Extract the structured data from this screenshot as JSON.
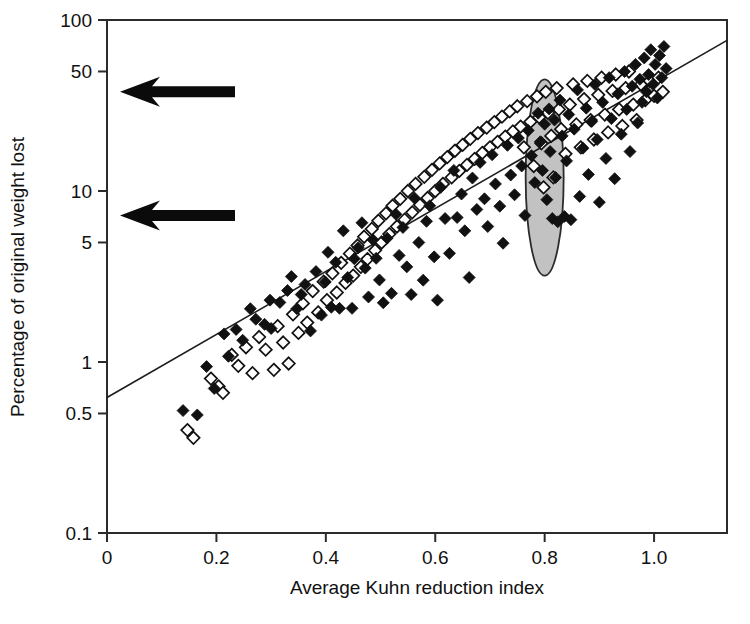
{
  "figure": {
    "background_color": "#ffffff",
    "foreground_color": "#111111",
    "highlight_fill_color": "#c2c2c2",
    "marker_filled_color": "#111111",
    "marker_open_color": "#ffffff",
    "caption_partial": ""
  },
  "chart_data": {
    "type": "scatter",
    "title": "",
    "xlabel": "Average Kuhn reduction index",
    "ylabel": "Percentage of original weight lost",
    "xlim": [
      0,
      1.1333
    ],
    "ylim": [
      0.1,
      100
    ],
    "yscale": "log",
    "xscale": "linear",
    "grid": false,
    "legend": "none",
    "xticks": [
      0,
      0.2,
      0.4,
      0.6,
      0.8,
      1.0
    ],
    "xtick_labels": [
      "0",
      "0.2",
      "0.4",
      "0.6",
      "0.8",
      "1.0"
    ],
    "yticks": [
      0.1,
      0.5,
      1,
      5,
      10,
      50,
      100
    ],
    "ytick_labels": [
      "0.1",
      "0.5",
      "1",
      "5",
      "10",
      "50",
      "100"
    ],
    "series": [
      {
        "name": "filled-diamonds",
        "marker": "filled-diamond",
        "points": [
          [
            0.139,
            0.52
          ],
          [
            0.165,
            0.49
          ],
          [
            0.182,
            0.94
          ],
          [
            0.196,
            0.7
          ],
          [
            0.214,
            1.46
          ],
          [
            0.222,
            1.08
          ],
          [
            0.236,
            1.55
          ],
          [
            0.248,
            1.34
          ],
          [
            0.262,
            2.05
          ],
          [
            0.272,
            1.78
          ],
          [
            0.288,
            1.66
          ],
          [
            0.298,
            2.3
          ],
          [
            0.3,
            1.57
          ],
          [
            0.316,
            2.23
          ],
          [
            0.33,
            2.62
          ],
          [
            0.337,
            3.16
          ],
          [
            0.347,
            2.05
          ],
          [
            0.355,
            2.48
          ],
          [
            0.362,
            2.84
          ],
          [
            0.372,
            1.52
          ],
          [
            0.382,
            3.38
          ],
          [
            0.392,
            1.88
          ],
          [
            0.399,
            2.94
          ],
          [
            0.404,
            4.38
          ],
          [
            0.41,
            2.09
          ],
          [
            0.418,
            3.83
          ],
          [
            0.425,
            2.06
          ],
          [
            0.432,
            5.85
          ],
          [
            0.44,
            3.12
          ],
          [
            0.448,
            2.06
          ],
          [
            0.452,
            4.02
          ],
          [
            0.459,
            4.66
          ],
          [
            0.466,
            6.52
          ],
          [
            0.472,
            3.54
          ],
          [
            0.478,
            2.4
          ],
          [
            0.486,
            5.19
          ],
          [
            0.492,
            4.04
          ],
          [
            0.498,
            3.02
          ],
          [
            0.505,
            2.22
          ],
          [
            0.512,
            5.3
          ],
          [
            0.52,
            2.52
          ],
          [
            0.528,
            7.32
          ],
          [
            0.534,
            4.2
          ],
          [
            0.541,
            6.12
          ],
          [
            0.548,
            3.6
          ],
          [
            0.556,
            2.48
          ],
          [
            0.562,
            9.1
          ],
          [
            0.57,
            5.0
          ],
          [
            0.578,
            3.01
          ],
          [
            0.584,
            6.65
          ],
          [
            0.59,
            8.2
          ],
          [
            0.598,
            4.12
          ],
          [
            0.604,
            2.3
          ],
          [
            0.61,
            10.5
          ],
          [
            0.618,
            6.9
          ],
          [
            0.626,
            4.32
          ],
          [
            0.634,
            13.2
          ],
          [
            0.64,
            7.0
          ],
          [
            0.648,
            9.6
          ],
          [
            0.654,
            5.85
          ],
          [
            0.662,
            3.12
          ],
          [
            0.668,
            11.9
          ],
          [
            0.676,
            7.8
          ],
          [
            0.682,
            14.7
          ],
          [
            0.69,
            9.0
          ],
          [
            0.696,
            6.2
          ],
          [
            0.704,
            16.3
          ],
          [
            0.71,
            11.0
          ],
          [
            0.718,
            8.15
          ],
          [
            0.724,
            4.95
          ],
          [
            0.732,
            18.5
          ],
          [
            0.738,
            12.4
          ],
          [
            0.745,
            9.5
          ],
          [
            0.752,
            20.4
          ],
          [
            0.758,
            14.0
          ],
          [
            0.764,
            7.2
          ],
          [
            0.77,
            22.6
          ],
          [
            0.776,
            16.1
          ],
          [
            0.782,
            11.2
          ],
          [
            0.788,
            28.5
          ],
          [
            0.792,
            19.4
          ],
          [
            0.796,
            13.2
          ],
          [
            0.8,
            24.6
          ],
          [
            0.804,
            8.9
          ],
          [
            0.808,
            30.2
          ],
          [
            0.81,
            17.0
          ],
          [
            0.814,
            6.9
          ],
          [
            0.818,
            26.0
          ],
          [
            0.82,
            12.0
          ],
          [
            0.824,
            6.6
          ],
          [
            0.828,
            34.0
          ],
          [
            0.832,
            21.0
          ],
          [
            0.836,
            7.1
          ],
          [
            0.84,
            15.0
          ],
          [
            0.844,
            28.0
          ],
          [
            0.848,
            6.8
          ],
          [
            0.854,
            23.0
          ],
          [
            0.86,
            39.0
          ],
          [
            0.864,
            9.3
          ],
          [
            0.87,
            17.8
          ],
          [
            0.876,
            30.5
          ],
          [
            0.88,
            12.5
          ],
          [
            0.886,
            25.5
          ],
          [
            0.892,
            42.0
          ],
          [
            0.896,
            20.0
          ],
          [
            0.9,
            8.6
          ],
          [
            0.906,
            33.0
          ],
          [
            0.912,
            15.5
          ],
          [
            0.918,
            46.0
          ],
          [
            0.922,
            26.5
          ],
          [
            0.928,
            11.8
          ],
          [
            0.934,
            37.0
          ],
          [
            0.94,
            21.5
          ],
          [
            0.946,
            50.0
          ],
          [
            0.95,
            30.0
          ],
          [
            0.956,
            17.0
          ],
          [
            0.96,
            41.0
          ],
          [
            0.966,
            55.0
          ],
          [
            0.97,
            25.0
          ],
          [
            0.974,
            45.0
          ],
          [
            0.978,
            33.0
          ],
          [
            0.982,
            60.0
          ],
          [
            0.986,
            38.0
          ],
          [
            0.99,
            48.0
          ],
          [
            0.994,
            67.0
          ],
          [
            0.998,
            42.0
          ],
          [
            1.002,
            55.0
          ],
          [
            1.006,
            35.0
          ],
          [
            1.01,
            62.0
          ],
          [
            1.014,
            46.0
          ],
          [
            1.018,
            70.0
          ],
          [
            1.022,
            52.0
          ]
        ]
      },
      {
        "name": "open-diamonds",
        "marker": "open-diamond",
        "points": [
          [
            0.147,
            0.4
          ],
          [
            0.158,
            0.36
          ],
          [
            0.19,
            0.8
          ],
          [
            0.204,
            0.72
          ],
          [
            0.212,
            0.66
          ],
          [
            0.228,
            1.1
          ],
          [
            0.24,
            0.95
          ],
          [
            0.254,
            1.22
          ],
          [
            0.266,
            0.86
          ],
          [
            0.278,
            1.4
          ],
          [
            0.29,
            1.18
          ],
          [
            0.305,
            0.9
          ],
          [
            0.312,
            1.62
          ],
          [
            0.322,
            1.3
          ],
          [
            0.332,
            0.98
          ],
          [
            0.34,
            1.9
          ],
          [
            0.35,
            1.48
          ],
          [
            0.358,
            2.2
          ],
          [
            0.366,
            1.7
          ],
          [
            0.376,
            2.6
          ],
          [
            0.386,
            1.95
          ],
          [
            0.396,
            2.95
          ],
          [
            0.402,
            2.3
          ],
          [
            0.412,
            3.3
          ],
          [
            0.42,
            2.55
          ],
          [
            0.428,
            3.8
          ],
          [
            0.436,
            2.9
          ],
          [
            0.444,
            4.3
          ],
          [
            0.45,
            3.2
          ],
          [
            0.458,
            4.8
          ],
          [
            0.464,
            3.6
          ],
          [
            0.47,
            5.4
          ],
          [
            0.476,
            4.0
          ],
          [
            0.484,
            6.0
          ],
          [
            0.49,
            4.5
          ],
          [
            0.496,
            6.7
          ],
          [
            0.502,
            5.0
          ],
          [
            0.51,
            7.4
          ],
          [
            0.516,
            5.6
          ],
          [
            0.522,
            8.2
          ],
          [
            0.53,
            6.2
          ],
          [
            0.536,
            9.0
          ],
          [
            0.544,
            6.8
          ],
          [
            0.55,
            10.0
          ],
          [
            0.558,
            7.5
          ],
          [
            0.564,
            11.0
          ],
          [
            0.572,
            8.3
          ],
          [
            0.58,
            12.1
          ],
          [
            0.586,
            9.1
          ],
          [
            0.594,
            13.3
          ],
          [
            0.6,
            10.0
          ],
          [
            0.608,
            14.5
          ],
          [
            0.614,
            11.0
          ],
          [
            0.622,
            15.8
          ],
          [
            0.63,
            12.0
          ],
          [
            0.636,
            17.2
          ],
          [
            0.644,
            13.1
          ],
          [
            0.65,
            18.6
          ],
          [
            0.658,
            14.2
          ],
          [
            0.664,
            20.2
          ],
          [
            0.672,
            15.4
          ],
          [
            0.678,
            21.8
          ],
          [
            0.686,
            16.7
          ],
          [
            0.694,
            23.5
          ],
          [
            0.7,
            18.0
          ],
          [
            0.708,
            25.3
          ],
          [
            0.714,
            19.4
          ],
          [
            0.722,
            27.2
          ],
          [
            0.728,
            20.8
          ],
          [
            0.736,
            29.2
          ],
          [
            0.742,
            22.3
          ],
          [
            0.75,
            31.3
          ],
          [
            0.756,
            23.8
          ],
          [
            0.762,
            18.0
          ],
          [
            0.768,
            33.5
          ],
          [
            0.774,
            25.4
          ],
          [
            0.78,
            14.0
          ],
          [
            0.786,
            35.8
          ],
          [
            0.79,
            27.0
          ],
          [
            0.794,
            19.0
          ],
          [
            0.798,
            10.5
          ],
          [
            0.802,
            38.0
          ],
          [
            0.806,
            28.6
          ],
          [
            0.812,
            21.0
          ],
          [
            0.816,
            12.0
          ],
          [
            0.822,
            40.0
          ],
          [
            0.826,
            30.0
          ],
          [
            0.83,
            23.0
          ],
          [
            0.838,
            16.5
          ],
          [
            0.846,
            32.0
          ],
          [
            0.852,
            42.0
          ],
          [
            0.858,
            24.5
          ],
          [
            0.866,
            18.0
          ],
          [
            0.872,
            34.5
          ],
          [
            0.878,
            44.0
          ],
          [
            0.884,
            26.0
          ],
          [
            0.89,
            20.0
          ],
          [
            0.898,
            36.5
          ],
          [
            0.904,
            46.0
          ],
          [
            0.91,
            28.0
          ],
          [
            0.916,
            22.0
          ],
          [
            0.924,
            38.5
          ],
          [
            0.93,
            48.0
          ],
          [
            0.936,
            30.0
          ],
          [
            0.942,
            24.0
          ],
          [
            0.948,
            40.0
          ],
          [
            0.954,
            50.0
          ],
          [
            0.962,
            32.0
          ],
          [
            0.968,
            26.0
          ],
          [
            0.976,
            42.0
          ],
          [
            0.984,
            34.0
          ],
          [
            0.992,
            44.0
          ],
          [
            1.0,
            36.0
          ],
          [
            1.008,
            46.0
          ],
          [
            1.016,
            38.0
          ]
        ]
      }
    ],
    "fit_line": {
      "name": "regression-line",
      "x": [
        0.0,
        1.1333
      ],
      "y": [
        0.62,
        76.0
      ]
    },
    "annotations": [
      {
        "name": "highlight-ellipse",
        "type": "ellipse",
        "center_x": 0.8,
        "center_y_low": 3.2,
        "center_y_high": 45.0,
        "fill": "#c2c2c2"
      },
      {
        "name": "arrow-upper",
        "type": "arrow",
        "direction": "left",
        "y_value": 38.0
      },
      {
        "name": "arrow-lower",
        "type": "arrow",
        "direction": "left",
        "y_value": 7.2
      }
    ]
  }
}
